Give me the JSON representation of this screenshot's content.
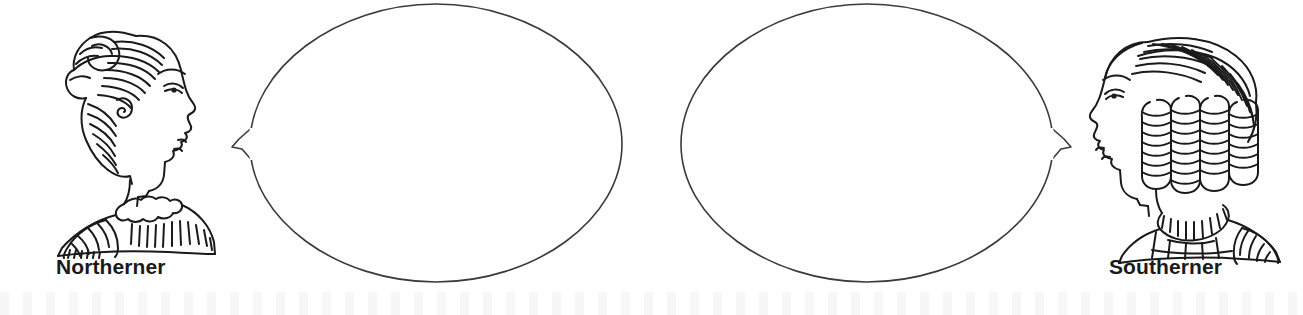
{
  "page": {
    "background_color": "#ffffff",
    "ink_color": "#1a1a1a",
    "width": 1303,
    "height": 315
  },
  "figures": [
    {
      "id": "northerner",
      "label": "Northerner",
      "icon": "woman-profile-updo-bun-icon",
      "facing": "right",
      "description": "Line-art profile portrait of a woman facing right with hair swept up into a bun and a high ruffled collar"
    },
    {
      "id": "southerner",
      "label": "Southerner",
      "icon": "woman-profile-ringlet-curls-icon",
      "facing": "left",
      "description": "Line-art profile portrait of a woman facing left with center-parted sleek hair and ringlet curls and a pleated collar"
    }
  ],
  "bubbles": [
    {
      "id": "northerner-bubble",
      "speaker": "Northerner",
      "shape": "ellipse",
      "tail_direction": "left",
      "text": "",
      "placeholder": ""
    },
    {
      "id": "southerner-bubble",
      "speaker": "Southerner",
      "shape": "ellipse",
      "tail_direction": "right",
      "text": "",
      "placeholder": ""
    }
  ]
}
